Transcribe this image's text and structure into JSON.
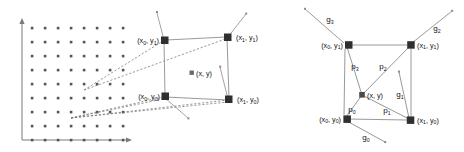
{
  "figure": {
    "title": "",
    "background": "#ffffff",
    "stroke": "#8c8c8c",
    "node_fill": "#2f2f2f",
    "dot_fill": "#555555",
    "text_color": "#111111"
  },
  "left_panel": {
    "name": "source-grid-panel",
    "axis": {
      "x_arrow": true,
      "y_arrow": true,
      "origin_x": 22,
      "origin_y": 140,
      "x_end": 128,
      "y_end": 20
    },
    "grid": {
      "cols": 8,
      "rows": 8,
      "x_start": 32,
      "y_start": 28,
      "step_x": 13,
      "step_y": 14,
      "dot_size": 2.4
    },
    "corners": [
      {
        "id": "x0y1",
        "label": "(x",
        "sub": "0",
        "label2": ", y",
        "sub2": "1",
        "label3": ")",
        "cx": 159,
        "cy": 41,
        "anchor": "end"
      },
      {
        "id": "x1y1",
        "label": "(x",
        "sub": "1",
        "label2": ", y",
        "sub2": "1",
        "label3": ")",
        "cx": 232,
        "cy": 37,
        "anchor": "start"
      },
      {
        "id": "x0y0",
        "label": "(x",
        "sub": "0",
        "label2": ", y",
        "sub2": "0",
        "label3": ")",
        "cx": 160,
        "cy": 96,
        "anchor": "end"
      },
      {
        "id": "x1y0",
        "label": "(x",
        "sub": "1",
        "label2": ", y",
        "sub2": "0",
        "label3": ")",
        "cx": 232,
        "cy": 99,
        "anchor": "start"
      }
    ],
    "center_point": {
      "label": "(x, y)",
      "cx": 196,
      "cy": 73
    },
    "source_points": [
      {
        "sx": 84,
        "sy": 89
      },
      {
        "sx": 84,
        "sy": 89
      },
      {
        "sx": 71,
        "sy": 117
      },
      {
        "sx": 71,
        "sy": 117
      }
    ]
  },
  "right_panel": {
    "name": "gradient-cell-panel",
    "corners": [
      {
        "id": "x0y1",
        "label": "(x",
        "sub": "0",
        "label2": ", y",
        "sub2": "1",
        "label3": ")",
        "cx": 345,
        "cy": 45,
        "anchor": "end"
      },
      {
        "id": "x1y1",
        "label": "(x",
        "sub": "1",
        "label2": ", y",
        "sub2": "1",
        "label3": ")",
        "cx": 411,
        "cy": 45,
        "anchor": "start"
      },
      {
        "id": "x0y0",
        "label": "(x",
        "sub": "0",
        "label2": ", y",
        "sub2": "0",
        "label3": ")",
        "cx": 343,
        "cy": 118,
        "anchor": "end"
      },
      {
        "id": "x1y0",
        "label": "(x",
        "sub": "1",
        "label2": ", y",
        "sub2": "0",
        "label3": ")",
        "cx": 410,
        "cy": 120,
        "anchor": "start"
      }
    ],
    "center_point": {
      "label": "(x, y)",
      "cx": 362,
      "cy": 95
    },
    "p_vectors": [
      {
        "id": "p0",
        "letter": "p",
        "sub": "0",
        "lx": 352,
        "ly": 111
      },
      {
        "id": "p1",
        "letter": "p",
        "sub": "1",
        "lx": 387,
        "ly": 112
      },
      {
        "id": "p2",
        "letter": "p",
        "sub": "2",
        "lx": 383,
        "ly": 68
      },
      {
        "id": "p3",
        "letter": "p",
        "sub": "3",
        "lx": 355,
        "ly": 68
      }
    ],
    "g_vectors": [
      {
        "id": "g0",
        "letter": "g",
        "sub": "0",
        "lx": 366,
        "ly": 139,
        "x1": 343,
        "y1": 118,
        "x2": 385,
        "y2": 142
      },
      {
        "id": "g1",
        "letter": "g",
        "sub": "1",
        "lx": 399,
        "ly": 95,
        "x1": 410,
        "y1": 120,
        "x2": 398,
        "y2": 73
      },
      {
        "id": "g2",
        "letter": "g",
        "sub": "2",
        "lx": 437,
        "ly": 29,
        "x1": 411,
        "y1": 45,
        "x2": 452,
        "y2": 11
      },
      {
        "id": "g3",
        "letter": "g",
        "sub": "3",
        "lx": 330,
        "ly": 20,
        "x1": 345,
        "y1": 45,
        "x2": 305,
        "y2": 9
      }
    ]
  }
}
